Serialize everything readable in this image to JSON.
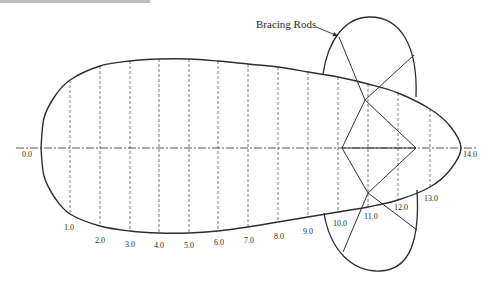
{
  "diagram": {
    "callout": {
      "label": "Bracing Rods",
      "x": 256,
      "y": 28,
      "arrow": {
        "x1": 316,
        "y1": 27,
        "x2": 338,
        "y2": 36
      }
    },
    "centerline": {
      "y": 148,
      "x_start": 16,
      "x_end": 478,
      "solid_from": 342,
      "solid_to": 416
    },
    "hull": {
      "nose_x": 41,
      "tail_x": 461,
      "top_profile": [
        [
          41,
          148
        ],
        [
          44,
          118
        ],
        [
          55,
          96
        ],
        [
          70,
          80
        ],
        [
          100,
          66
        ],
        [
          130,
          61
        ],
        [
          159,
          59
        ],
        [
          189,
          59
        ],
        [
          218,
          61
        ],
        [
          248,
          64
        ],
        [
          278,
          67
        ],
        [
          308,
          72
        ],
        [
          338,
          77
        ],
        [
          368,
          84
        ],
        [
          398,
          93
        ],
        [
          430,
          109
        ],
        [
          450,
          126
        ],
        [
          461,
          148
        ]
      ],
      "bottom_profile": [
        [
          461,
          148
        ],
        [
          450,
          170
        ],
        [
          430,
          187
        ],
        [
          398,
          200
        ],
        [
          368,
          207
        ],
        [
          338,
          212
        ],
        [
          308,
          217
        ],
        [
          278,
          222
        ],
        [
          248,
          227
        ],
        [
          218,
          231
        ],
        [
          189,
          233
        ],
        [
          159,
          233
        ],
        [
          130,
          231
        ],
        [
          100,
          226
        ],
        [
          70,
          214
        ],
        [
          55,
          198
        ],
        [
          44,
          176
        ],
        [
          41,
          148
        ]
      ]
    },
    "stations": [
      {
        "label": "0.0",
        "x": 41,
        "label_x": 22,
        "label_y": 157
      },
      {
        "label": "1.0",
        "x": 70,
        "top": 80,
        "bottom": 214,
        "label_x": 64,
        "label_y": 230
      },
      {
        "label": "2.0",
        "x": 100,
        "top": 66,
        "bottom": 226,
        "label_x": 95,
        "label_y": 243
      },
      {
        "label": "3.0",
        "x": 130,
        "top": 61,
        "bottom": 231,
        "label_x": 125,
        "label_y": 247
      },
      {
        "label": "4.0",
        "x": 159,
        "top": 59,
        "bottom": 233,
        "label_x": 154,
        "label_y": 248
      },
      {
        "label": "5.0",
        "x": 189,
        "top": 59,
        "bottom": 233,
        "label_x": 184,
        "label_y": 248
      },
      {
        "label": "6.0",
        "x": 218,
        "top": 61,
        "bottom": 231,
        "label_x": 214,
        "label_y": 245
      },
      {
        "label": "7.0",
        "x": 248,
        "top": 64,
        "bottom": 227,
        "label_x": 244,
        "label_y": 243
      },
      {
        "label": "8.0",
        "x": 278,
        "top": 67,
        "bottom": 222,
        "label_x": 274,
        "label_y": 239
      },
      {
        "label": "9.0",
        "x": 308,
        "top": 72,
        "bottom": 217,
        "label_x": 303,
        "label_y": 234
      },
      {
        "label": "10.0",
        "x": 338,
        "top": 77,
        "bottom": 212,
        "label_x": 333,
        "label_y": 226
      },
      {
        "label": "11.0",
        "x": 368,
        "top": 84,
        "bottom": 207,
        "label_x": 364,
        "label_y": 219
      },
      {
        "label": "12.0",
        "x": 398,
        "top": 93,
        "bottom": 200,
        "label_x": 394,
        "label_y": 210
      },
      {
        "label": "13.0",
        "x": 430,
        "top": 109,
        "bottom": 187,
        "label_x": 424,
        "label_y": 201
      },
      {
        "label": "14.0",
        "x": 461,
        "label_x": 463,
        "label_y": 157
      }
    ],
    "upper_fin": {
      "path": "M 323 74 C 328 40, 345 17, 370 17 C 400 17, 418 45, 416 97"
    },
    "lower_fin": {
      "path": "M 324 213 C 330 250, 352 272, 380 271 C 410 270, 420 240, 417 190"
    },
    "bracing": {
      "diamond": [
        [
          342,
          148
        ],
        [
          365,
          100
        ],
        [
          416,
          148
        ],
        [
          368,
          193
        ]
      ],
      "upper_rods": [
        [
          339,
          37,
          365,
          100
        ],
        [
          414,
          55,
          365,
          100
        ]
      ],
      "lower_rods": [
        [
          368,
          193,
          343,
          252
        ],
        [
          368,
          193,
          417,
          230
        ]
      ]
    }
  }
}
